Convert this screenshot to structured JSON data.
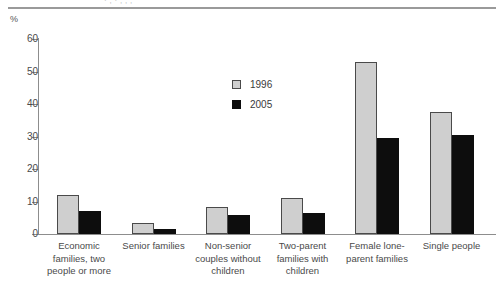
{
  "figure": {
    "title_fragment": "·  ,  ·  ,  ,  ,",
    "unit_label": "%"
  },
  "chart_data": {
    "type": "bar",
    "title": "",
    "xlabel": "",
    "ylabel": "%",
    "ylim": [
      0,
      60
    ],
    "yticks": [
      0,
      10,
      20,
      30,
      40,
      50,
      60
    ],
    "grid": false,
    "legend_position": "inside-upper-center",
    "categories": [
      "Economic families, two people or more",
      "Senior families",
      "Non-senior couples without children",
      "Two-parent families with children",
      "Female lone-parent families",
      "Single people"
    ],
    "category_lines": [
      [
        "Economic",
        "families, two",
        "people or more"
      ],
      [
        "Senior families"
      ],
      [
        "Non-senior",
        "couples without",
        "children"
      ],
      [
        "Two-parent",
        "families with",
        "children"
      ],
      [
        "Female lone-",
        "parent families"
      ],
      [
        "Single people"
      ]
    ],
    "series": [
      {
        "name": "1996",
        "color": "#cfcfcf",
        "values": [
          12.0,
          3.5,
          8.2,
          11.0,
          52.8,
          37.6
        ]
      },
      {
        "name": "2005",
        "color": "#0d0d0d",
        "values": [
          7.0,
          1.5,
          6.0,
          6.5,
          29.4,
          30.6
        ]
      }
    ]
  }
}
